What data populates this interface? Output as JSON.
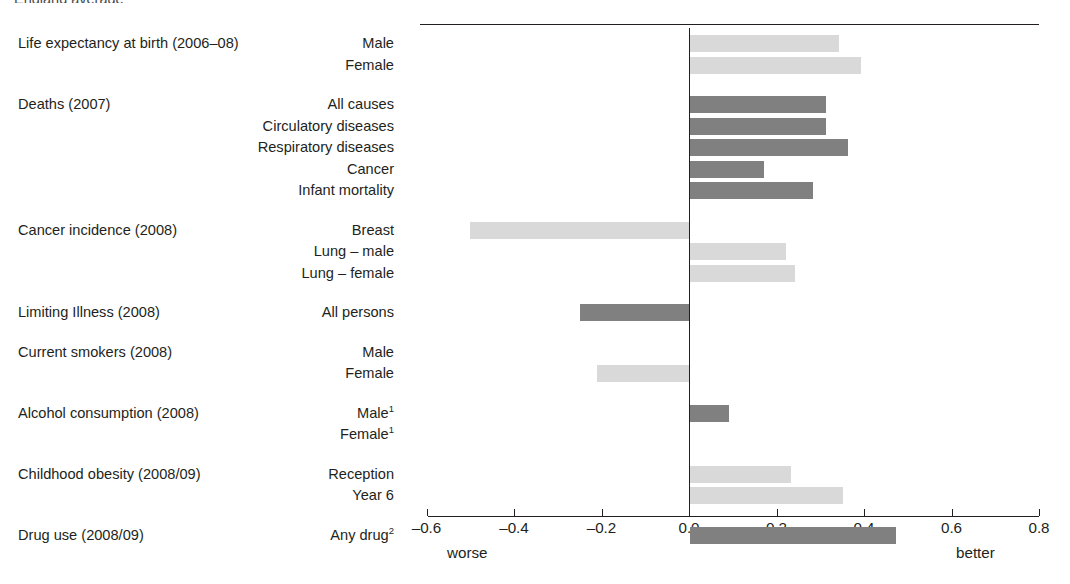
{
  "top_fragment": "England average",
  "axis": {
    "ticks": [
      -0.6,
      -0.4,
      -0.2,
      0.0,
      0.2,
      0.4,
      0.6,
      0.8
    ],
    "tick_labels": [
      "–0.6",
      "–0.4",
      "–0.2",
      "0.0",
      "0.2",
      "0.4",
      "0.6",
      "0.8"
    ],
    "worse_label": "worse",
    "better_label": "better",
    "min": -0.6,
    "max": 0.8
  },
  "colors": {
    "bar_light": "#d9d9d9",
    "bar_dark": "#808080",
    "axis": "#231f20",
    "text": "#231f20"
  },
  "chart_data": {
    "type": "bar",
    "title": "",
    "subtitle": "",
    "xlabel": "",
    "ylabel": "",
    "orientation": "horizontal",
    "xlim": [
      -0.6,
      0.8
    ],
    "grid": false,
    "legend": "none",
    "annotations": [
      "worse",
      "better"
    ],
    "groups": [
      {
        "title": "Life expectancy at birth (2006–08)",
        "rows": [
          {
            "label": "Male",
            "value": 0.34,
            "shade": "light"
          },
          {
            "label": "Female",
            "value": 0.39,
            "shade": "light"
          }
        ]
      },
      {
        "title": "Deaths (2007)",
        "rows": [
          {
            "label": "All causes",
            "value": 0.31,
            "shade": "dark"
          },
          {
            "label": "Circulatory diseases",
            "value": 0.31,
            "shade": "dark"
          },
          {
            "label": "Respiratory diseases",
            "value": 0.36,
            "shade": "dark"
          },
          {
            "label": "Cancer",
            "value": 0.17,
            "shade": "dark"
          },
          {
            "label": "Infant mortality",
            "value": 0.28,
            "shade": "dark"
          }
        ]
      },
      {
        "title": "Cancer incidence (2008)",
        "rows": [
          {
            "label": "Breast",
            "value": -0.5,
            "shade": "light"
          },
          {
            "label": "Lung – male",
            "value": 0.22,
            "shade": "light"
          },
          {
            "label": "Lung – female",
            "value": 0.24,
            "shade": "light"
          }
        ]
      },
      {
        "title": "Limiting Illness (2008)",
        "rows": [
          {
            "label": "All persons",
            "value": -0.25,
            "shade": "dark"
          }
        ]
      },
      {
        "title": "Current smokers (2008)",
        "rows": [
          {
            "label": "Male",
            "value": 0.0,
            "shade": "light"
          },
          {
            "label": "Female",
            "value": -0.21,
            "shade": "light"
          }
        ]
      },
      {
        "title": "Alcohol consumption (2008)",
        "rows": [
          {
            "label": "Male",
            "sup": "1",
            "value": 0.09,
            "shade": "dark"
          },
          {
            "label": "Female",
            "sup": "1",
            "value": 0.0,
            "shade": "dark"
          }
        ]
      },
      {
        "title": "Childhood obesity (2008/09)",
        "rows": [
          {
            "label": "Reception",
            "value": 0.23,
            "shade": "light"
          },
          {
            "label": "Year 6",
            "value": 0.35,
            "shade": "light"
          }
        ]
      },
      {
        "title": "Drug use (2008/09)",
        "rows": [
          {
            "label": "Any drug",
            "sup": "2",
            "value": 0.47,
            "shade": "dark"
          }
        ]
      }
    ]
  }
}
